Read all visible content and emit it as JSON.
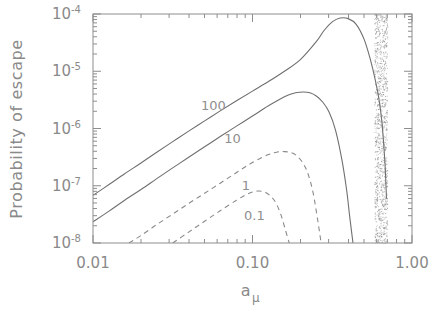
{
  "chart_data": {
    "type": "line",
    "title": "",
    "xlabel": "a_mu",
    "xlabel_base": "a",
    "xlabel_sub": "μ",
    "ylabel": "Probability of escape",
    "xscale": "log",
    "yscale": "log",
    "xlim": [
      0.01,
      1.0
    ],
    "ylim": [
      1e-08,
      0.0001
    ],
    "grid": false,
    "legend": "inline-curve-labels",
    "xticks": [
      0.01,
      0.1,
      1.0
    ],
    "xtick_labels": [
      "0.01",
      "0.10",
      "1.00"
    ],
    "yticks": [
      1e-08,
      1e-07,
      1e-06,
      1e-05,
      0.0001
    ],
    "ytick_labels": [
      "10⁻⁸",
      "10⁻⁷",
      "10⁻⁶",
      "10⁻⁵",
      "10⁻⁴"
    ],
    "ytick_mantissa": "10",
    "ytick_exponents": [
      "-8",
      "-7",
      "-6",
      "-5",
      "-4"
    ],
    "annotations": [
      {
        "text": "100",
        "x": 0.0475,
        "y": 2.1e-06,
        "name": "curve-label-100"
      },
      {
        "text": "10",
        "x": 0.0665,
        "y": 5.6e-07,
        "name": "curve-label-10"
      },
      {
        "text": "1",
        "x": 0.0855,
        "y": 8.3e-08,
        "name": "curve-label-1"
      },
      {
        "text": "0.1",
        "x": 0.0885,
        "y": 2.55e-08,
        "name": "curve-label-0p1"
      }
    ],
    "shaded_band": {
      "name": "forbidden-region-band",
      "style": "stipple",
      "x_start": 0.58,
      "x_end": 0.7,
      "color": "#8a8a8a"
    },
    "series": [
      {
        "name": "100",
        "label": "100",
        "style": "solid",
        "color": "#6f6f6f",
        "x": [
          0.01,
          0.0126,
          0.0158,
          0.02,
          0.0251,
          0.0316,
          0.0398,
          0.0501,
          0.0631,
          0.0794,
          0.1,
          0.1259,
          0.1585,
          0.1995,
          0.2512,
          0.2818,
          0.3162,
          0.3548,
          0.3981,
          0.4467,
          0.5012,
          0.55,
          0.5888,
          0.6166,
          0.6457,
          0.6761,
          0.6918
        ],
        "y": [
          6.8e-08,
          1.05e-07,
          1.62e-07,
          2.5e-07,
          3.85e-07,
          5.9e-07,
          9e-07,
          1.36e-06,
          2.05e-06,
          3.05e-06,
          4.5e-06,
          6.6e-06,
          1e-05,
          1.6e-05,
          3.3e-05,
          5.2e-05,
          7.3e-05,
          8.5e-05,
          8.3e-05,
          6.6e-05,
          3.6e-05,
          1.55e-05,
          7e-06,
          3.6e-06,
          1.4e-06,
          2.6e-07,
          6e-08
        ]
      },
      {
        "name": "10",
        "label": "10",
        "style": "solid",
        "color": "#6f6f6f",
        "x": [
          0.01,
          0.0126,
          0.0158,
          0.02,
          0.0251,
          0.0316,
          0.0398,
          0.0501,
          0.0631,
          0.0794,
          0.1,
          0.1259,
          0.1585,
          0.1862,
          0.2089,
          0.2291,
          0.2512,
          0.2754,
          0.302,
          0.3311,
          0.3631,
          0.389,
          0.4074,
          0.4266
        ],
        "y": [
          2.35e-08,
          3.6e-08,
          5.6e-08,
          8.6e-08,
          1.33e-07,
          2.05e-07,
          3.15e-07,
          4.8e-07,
          7.3e-07,
          1.1e-06,
          1.65e-06,
          2.5e-06,
          3.6e-06,
          4.2e-06,
          4.35e-06,
          4.2e-06,
          3.7e-06,
          2.9e-06,
          1.95e-06,
          9.5e-07,
          2.9e-07,
          8.5e-08,
          2.8e-08,
          1e-08
        ]
      },
      {
        "name": "1",
        "label": "1",
        "style": "dashed",
        "color": "#8a8a8a",
        "x": [
          0.0168,
          0.02,
          0.0251,
          0.0316,
          0.0398,
          0.0501,
          0.0631,
          0.0794,
          0.1,
          0.1259,
          0.1445,
          0.1585,
          0.1738,
          0.1905,
          0.2089,
          0.2239,
          0.2399,
          0.257,
          0.2692
        ],
        "y": [
          1e-08,
          1.35e-08,
          2.1e-08,
          3.2e-08,
          4.9e-08,
          7.4e-08,
          1.12e-07,
          1.7e-07,
          2.55e-07,
          3.5e-07,
          3.9e-07,
          3.95e-07,
          3.8e-07,
          3.3e-07,
          2.4e-07,
          1.55e-07,
          7.5e-08,
          2.4e-08,
          1e-08
        ]
      },
      {
        "name": "0.1",
        "label": "0.1",
        "style": "dashed",
        "color": "#8a8a8a",
        "x": [
          0.0316,
          0.0398,
          0.0501,
          0.0631,
          0.0794,
          0.0912,
          0.1,
          0.1096,
          0.1202,
          0.1318,
          0.1413,
          0.1514,
          0.1607,
          0.17
        ],
        "y": [
          1e-08,
          1.55e-08,
          2.4e-08,
          3.7e-08,
          5.6e-08,
          7e-08,
          7.8e-08,
          8.1e-08,
          7.7e-08,
          6.3e-08,
          4.8e-08,
          3e-08,
          1.7e-08,
          1e-08
        ]
      }
    ]
  }
}
